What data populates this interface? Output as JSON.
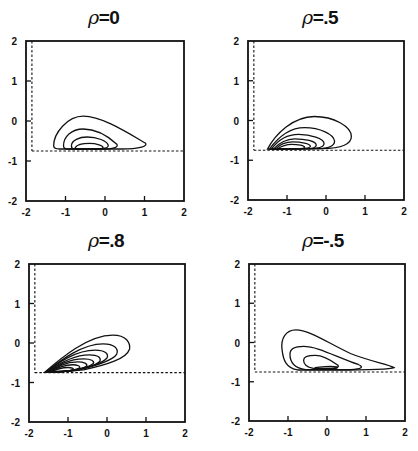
{
  "figure": {
    "background": "#ffffff",
    "ink": "#111111"
  },
  "chart_data": [
    {
      "type": "contour",
      "title": "ρ=0",
      "rho_symbol": "ρ",
      "rho_value": "=0",
      "xlim": [
        -2,
        2
      ],
      "ylim": [
        -2,
        2
      ],
      "xticks": [
        "-2",
        "-1",
        "0",
        "1",
        "2"
      ],
      "yticks": [
        "-2",
        "-1",
        "0",
        "1",
        "2"
      ],
      "grid": false,
      "dashed_lines": {
        "vertical_x": -1.85,
        "horizontal_y": -0.75
      },
      "contours": [
        "M -1.30 -0.62 C -1.30 -0.30, -0.95 0.12, -0.55 0.12 C -0.10 0.12, 0.50 -0.25, 1.02 -0.55 C 1.10 -0.62, 0.90 -0.70, 0.40 -0.70 L -1.15 -0.70 C -1.28 -0.70, -1.30 -0.66, -1.30 -0.62 Z",
        "M -1.05 -0.62 C -1.05 -0.40, -0.85 -0.20, -0.55 -0.20 C -0.20 -0.20, 0.10 -0.40, 0.30 -0.58 C 0.35 -0.66, 0.20 -0.70, -0.10 -0.70 L -0.95 -0.70 C -1.03 -0.70, -1.05 -0.66, -1.05 -0.62 Z",
        "M -0.85 -0.62 C -0.85 -0.48, -0.65 -0.40, -0.45 -0.40 C -0.20 -0.40, 0.05 -0.50, 0.08 -0.60 C 0.10 -0.68, -0.05 -0.70, -0.25 -0.70 L -0.78 -0.70 C -0.84 -0.70, -0.85 -0.66, -0.85 -0.62 Z",
        "M -0.75 -0.66 C -0.70 -0.58, -0.55 -0.56, -0.40 -0.56 C -0.20 -0.56, -0.05 -0.62, -0.05 -0.66 C -0.05 -0.70, -0.30 -0.71, -0.45 -0.71 C -0.65 -0.71, -0.78 -0.70, -0.75 -0.66 Z"
      ]
    },
    {
      "type": "contour",
      "title": "ρ=.5",
      "rho_symbol": "ρ",
      "rho_value": "=.5",
      "xlim": [
        -2,
        2
      ],
      "ylim": [
        -2,
        2
      ],
      "xticks": [
        "-2",
        "-1",
        "0",
        "1",
        "2"
      ],
      "yticks": [
        "-2",
        "-1",
        "0",
        "1",
        "2"
      ],
      "grid": false,
      "dashed_lines": {
        "vertical_x": -1.85,
        "horizontal_y": -0.75
      },
      "contours": [
        "M -1.50 -0.72 C -1.30 -0.35, -0.85 0.10, -0.30 0.10 C 0.20 0.10, 0.65 -0.15, 0.65 -0.40 C 0.65 -0.62, 0.30 -0.70, -0.10 -0.71 L -1.50 -0.72 Z",
        "M -1.45 -0.72 C -1.25 -0.45, -0.95 -0.18, -0.55 -0.18 C -0.15 -0.18, 0.20 -0.35, 0.22 -0.52 C 0.22 -0.65, 0.00 -0.71, -0.30 -0.71 L -1.45 -0.72 Z",
        "M -1.40 -0.72 C -1.25 -0.52, -1.00 -0.35, -0.70 -0.35 C -0.40 -0.35, -0.05 -0.45, -0.05 -0.58 C -0.05 -0.68, -0.25 -0.71, -0.45 -0.71 L -1.40 -0.72 Z",
        "M -1.35 -0.72 C -1.22 -0.58, -1.02 -0.46, -0.80 -0.46 C -0.55 -0.46, -0.25 -0.52, -0.25 -0.62 C -0.25 -0.69, -0.40 -0.71, -0.55 -0.71 L -1.35 -0.72 Z",
        "M -1.30 -0.72 C -1.20 -0.62, -1.05 -0.54, -0.85 -0.54 C -0.65 -0.54, -0.40 -0.58, -0.40 -0.65 C -0.40 -0.70, -0.55 -0.71, -0.68 -0.71 L -1.30 -0.72 Z",
        "M -1.25 -0.72 C -1.15 -0.65, -1.02 -0.60, -0.88 -0.60 C -0.72 -0.60, -0.55 -0.63, -0.55 -0.67 C -0.55 -0.71, -0.65 -0.71, -0.75 -0.71 L -1.25 -0.72 Z"
      ]
    },
    {
      "type": "contour",
      "title": "ρ=.8",
      "rho_symbol": "ρ",
      "rho_value": "=.8",
      "xlim": [
        -2,
        2
      ],
      "ylim": [
        -2,
        2
      ],
      "xticks": [
        "-2",
        "-1",
        "0",
        "1",
        "2"
      ],
      "yticks": [
        "-2",
        "-1",
        "0",
        "1",
        "2"
      ],
      "grid": false,
      "dashed_lines": {
        "vertical_x": -1.85,
        "horizontal_y": -0.75
      },
      "contours": [
        "M -1.60 -0.74 C -1.20 -0.40, -0.50 0.20, 0.15 0.20 C 0.50 0.20, 0.60 0.00, 0.58 -0.15 C 0.50 -0.40, 0.00 -0.55, -0.60 -0.68 L -1.60 -0.74 Z",
        "M -1.58 -0.74 C -1.20 -0.45, -0.65 -0.02, -0.10 -0.02 C 0.20 -0.02, 0.30 -0.15, 0.25 -0.28 C 0.15 -0.45, -0.30 -0.58, -0.80 -0.70 L -1.58 -0.74 Z",
        "M -1.56 -0.74 C -1.25 -0.50, -0.80 -0.18, -0.30 -0.18 C -0.05 -0.18, 0.05 -0.28, 0.00 -0.38 C -0.10 -0.50, -0.45 -0.62, -0.95 -0.71 L -1.56 -0.74 Z",
        "M -1.54 -0.74 C -1.28 -0.55, -0.90 -0.30, -0.45 -0.30 C -0.22 -0.30, -0.15 -0.38, -0.18 -0.46 C -0.28 -0.56, -0.60 -0.66, -1.05 -0.72 L -1.54 -0.74 Z",
        "M -1.52 -0.74 C -1.30 -0.60, -1.00 -0.40, -0.60 -0.40 C -0.40 -0.40, -0.32 -0.46, -0.35 -0.52 C -0.45 -0.60, -0.75 -0.68, -1.15 -0.73 L -1.52 -0.74 Z",
        "M -1.50 -0.74 C -1.32 -0.63, -1.08 -0.48, -0.75 -0.48 C -0.58 -0.48, -0.50 -0.53, -0.52 -0.58 C -0.60 -0.64, -0.85 -0.70, -1.20 -0.73 L -1.50 -0.74 Z",
        "M -1.48 -0.74 C -1.34 -0.66, -1.15 -0.55, -0.88 -0.55 C -0.75 -0.55, -0.68 -0.59, -0.70 -0.63 C -0.76 -0.67, -0.95 -0.71, -1.25 -0.73 L -1.48 -0.74 Z",
        "M -1.46 -0.74 C -1.36 -0.69, -1.22 -0.62, -1.00 -0.62 C -0.90 -0.62, -0.85 -0.65, -0.86 -0.67 C -0.92 -0.70, -1.05 -0.72, -1.30 -0.73 L -1.46 -0.74 Z"
      ]
    },
    {
      "type": "contour",
      "title": "ρ=-.5",
      "rho_symbol": "ρ",
      "rho_value": "=-.5",
      "xlim": [
        -2,
        2
      ],
      "ylim": [
        -2,
        2
      ],
      "xticks": [
        "-2",
        "-1",
        "0",
        "1",
        "2"
      ],
      "yticks": [
        "-2",
        "-1",
        "0",
        "1",
        "2"
      ],
      "grid": false,
      "dashed_lines": {
        "vertical_x": -1.85,
        "horizontal_y": -0.75
      },
      "contours": [
        "M -1.15 -0.20 C -1.20 0.10, -1.05 0.32, -0.80 0.32 C -0.45 0.32, 0.00 0.00, 0.60 -0.28 C 1.10 -0.48, 1.60 -0.56, 1.72 -0.64 C 1.60 -0.70, 0.80 -0.70, 0.20 -0.70 L -0.75 -0.70 C -1.05 -0.65, -1.12 -0.45, -1.15 -0.20 Z",
        "M -0.95 -0.30 C -0.95 -0.15, -0.80 -0.10, -0.60 -0.10 C -0.25 -0.10, 0.20 -0.35, 0.80 -0.56 C 0.95 -0.62, 0.90 -0.68, 0.60 -0.69 L -0.55 -0.69 C -0.85 -0.65, -0.95 -0.50, -0.95 -0.30 Z",
        "M -0.60 -0.45 C -0.60 -0.35, -0.45 -0.33, -0.30 -0.33 C -0.10 -0.33, 0.10 -0.45, 0.28 -0.58 C 0.32 -0.63, 0.25 -0.66, 0.05 -0.66 L -0.35 -0.66 C -0.55 -0.62, -0.60 -0.55, -0.60 -0.45 Z",
        "M -0.30 -0.64 C -0.20 -0.62, 0.10 -0.60, 0.25 -0.62 C 0.30 -0.64, 0.25 -0.67, 0.05 -0.67 L -0.30 -0.67 Z"
      ]
    }
  ],
  "layout": {
    "panels": [
      {
        "title_x": 88,
        "title_y": 6,
        "frame": [
          26,
          41,
          184,
          201
        ]
      },
      {
        "title_x": 302,
        "title_y": 6,
        "frame": [
          248,
          41,
          404,
          200
        ]
      },
      {
        "title_x": 88,
        "title_y": 229,
        "frame": [
          29,
          264,
          185,
          422
        ]
      },
      {
        "title_x": 302,
        "title_y": 229,
        "frame": [
          249,
          264,
          405,
          421
        ]
      }
    ]
  }
}
